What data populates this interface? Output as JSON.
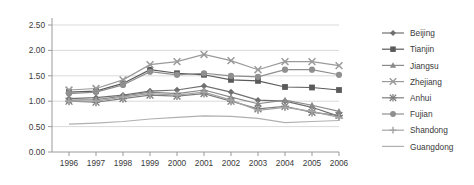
{
  "chart_data": {
    "type": "line",
    "title": "",
    "xlabel": "",
    "ylabel": "",
    "x": [
      1996,
      1997,
      1998,
      1999,
      2000,
      2001,
      2002,
      2003,
      2004,
      2005,
      2006
    ],
    "categories": [
      "1996",
      "1997",
      "1998",
      "1999",
      "2000",
      "2001",
      "2002",
      "2003",
      "2004",
      "2005",
      "2006"
    ],
    "ylim": [
      0.0,
      2.5
    ],
    "ytick_labels": [
      "0.00",
      "0.50",
      "1.00",
      "1.50",
      "2.00",
      "2.50"
    ],
    "ytick_values": [
      0.0,
      0.5,
      1.0,
      1.5,
      2.0,
      2.5
    ],
    "ystep": 0.5,
    "grid": true,
    "legend_position": "right",
    "series": [
      {
        "name": "Beijing",
        "marker": "diamond",
        "color": "#6f6f6f",
        "values": [
          1.05,
          1.07,
          1.12,
          1.2,
          1.22,
          1.3,
          1.18,
          1.02,
          1.0,
          0.88,
          0.7
        ]
      },
      {
        "name": "Tianjin",
        "marker": "square",
        "color": "#5a5a5a",
        "values": [
          1.18,
          1.2,
          1.35,
          1.62,
          1.55,
          1.52,
          1.42,
          1.4,
          1.28,
          1.27,
          1.22
        ]
      },
      {
        "name": "Jiangsu",
        "marker": "triangle",
        "color": "#8a8a8a",
        "values": [
          1.02,
          1.03,
          1.1,
          1.18,
          1.15,
          1.22,
          1.08,
          0.95,
          1.02,
          0.92,
          0.8
        ]
      },
      {
        "name": "Zhejiang",
        "marker": "cross-x",
        "color": "#9a9a9a",
        "values": [
          1.22,
          1.25,
          1.42,
          1.72,
          1.78,
          1.92,
          1.8,
          1.62,
          1.78,
          1.78,
          1.7
        ]
      },
      {
        "name": "Anhui",
        "marker": "star",
        "color": "#7d7d7d",
        "values": [
          1.0,
          0.98,
          1.05,
          1.12,
          1.1,
          1.15,
          1.0,
          0.85,
          0.9,
          0.78,
          0.72
        ]
      },
      {
        "name": "Fujian",
        "marker": "circle",
        "color": "#8f8f8f",
        "values": [
          1.15,
          1.18,
          1.32,
          1.58,
          1.52,
          1.55,
          1.5,
          1.48,
          1.62,
          1.62,
          1.52
        ]
      },
      {
        "name": "Shandong",
        "marker": "plus",
        "color": "#a5a5a5",
        "values": [
          1.0,
          1.0,
          1.08,
          1.15,
          1.12,
          1.18,
          1.02,
          0.82,
          0.88,
          0.8,
          0.68
        ]
      },
      {
        "name": "Guangdong",
        "marker": "none",
        "color": "#b0b0b0",
        "values": [
          0.55,
          0.57,
          0.6,
          0.65,
          0.68,
          0.71,
          0.7,
          0.66,
          0.58,
          0.6,
          0.62
        ]
      }
    ]
  },
  "legend": {
    "items": [
      {
        "label": "Beijing"
      },
      {
        "label": "Tianjin"
      },
      {
        "label": "Jiangsu"
      },
      {
        "label": "Zhejiang"
      },
      {
        "label": "Anhui"
      },
      {
        "label": "Fujian"
      },
      {
        "label": "Shandong"
      },
      {
        "label": "Guangdong"
      }
    ]
  }
}
